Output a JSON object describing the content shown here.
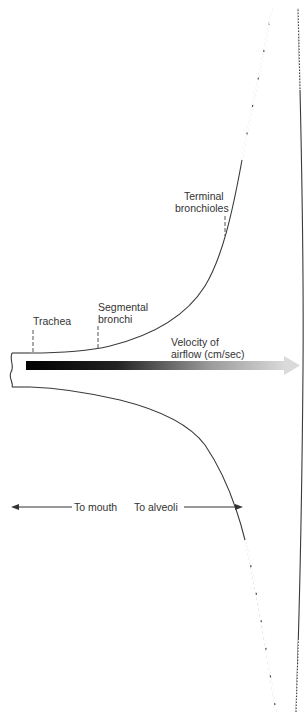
{
  "diagram": {
    "type": "airway cross-sectional area vs airflow velocity",
    "labels": {
      "trachea": "Trachea",
      "segmental_1": "Segmental",
      "segmental_2": "bronchi",
      "terminal_1": "Terminal",
      "terminal_2": "bronchioles",
      "velocity_1": "Velocity of",
      "velocity_2": "airflow (cm/sec)",
      "to_mouth": "To mouth",
      "to_alveoli": "To alveoli"
    },
    "colors": {
      "line": "#3a3a3a",
      "arrow_start": "#000000",
      "arrow_end": "#d8d8d8",
      "text": "#333333"
    }
  }
}
